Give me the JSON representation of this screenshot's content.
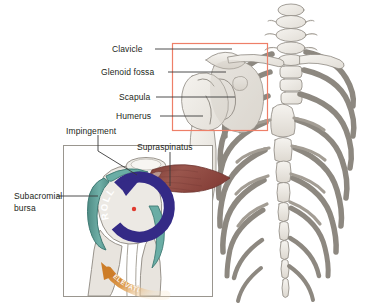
{
  "figure": {
    "background_color": "#ffffff",
    "width": 382,
    "height": 305
  },
  "colors": {
    "bone_fill": "#ece9e4",
    "bone_fill_light": "#f3f1ed",
    "bone_outline": "#8d8880",
    "bone_shadow": "#d7d2ca",
    "callout_box": "#ee7f68",
    "inset_border": "#9a968f",
    "bursa_teal": "#5f9e97",
    "bursa_teal_dark": "#3f7a74",
    "roll_purple": "#342a86",
    "muscle_red": "#8d4a42",
    "muscle_red_dark": "#6d3530",
    "elevation_orange": "#d9862f",
    "center_dot_red": "#e03a2f",
    "label_text": "#231f20",
    "leader_line": "#3a3a3a"
  },
  "labels": {
    "clavicle": "Clavicle",
    "glenoid_fossa": "Glenoid fossa",
    "scapula": "Scapula",
    "humerus": "Humerus",
    "impingement": "Impingement",
    "supraspinatus": "Supraspinatus",
    "subacromial_bursa_line1": "Subacromial",
    "subacromial_bursa_line2": "bursa"
  },
  "annotations": {
    "roll_arrow_text": "ROLL",
    "elevation_arrow_text": "ELEVATION"
  },
  "regions": {
    "skeleton_panel": "posterior thorax and shoulder girdle skeleton",
    "callout_rect": "shoulder joint detail frame",
    "inset_panel": "magnified glenohumeral joint with subacromial bursa"
  }
}
